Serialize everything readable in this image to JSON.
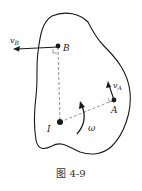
{
  "figure": {
    "caption": "图 4-9",
    "points": {
      "B": {
        "label": "B",
        "x": 58,
        "y": 46
      },
      "A": {
        "label": "A",
        "x": 114,
        "y": 100
      },
      "I": {
        "label": "I",
        "x": 60,
        "y": 122
      }
    },
    "vectors": {
      "vB": {
        "symbol": "v",
        "subscript": "B",
        "from": [
          58,
          47
        ],
        "to": [
          14,
          49
        ]
      },
      "vA": {
        "symbol": "v",
        "subscript": "A",
        "from": [
          114,
          100
        ],
        "to": [
          108,
          82
        ]
      }
    },
    "angular_velocity": {
      "label": "ω"
    },
    "colors": {
      "stroke": "#1a1a1a",
      "dashed": "#777777",
      "background": "#ffffff"
    }
  }
}
